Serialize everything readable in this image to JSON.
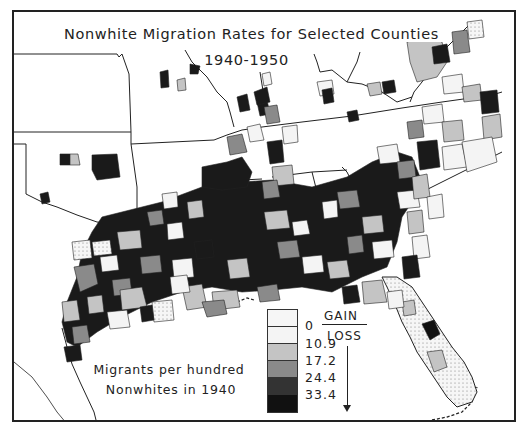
{
  "title": {
    "line1": "Nonwhite Migration Rates for Selected Counties",
    "line2": "1940-1950"
  },
  "legend": {
    "direction_top": "GAIN",
    "direction_bottom": "LOSS",
    "breaks": [
      "0",
      "10.9",
      "17.2",
      "24.4",
      "33.4"
    ],
    "classes": [
      {
        "range": "gain (>0)",
        "fill": "#f2f2f2",
        "pattern": "dotted"
      },
      {
        "range": "0 to 10.9",
        "fill": "#f4f4f4",
        "pattern": "solid"
      },
      {
        "range": "10.9 to 17.2",
        "fill": "#c4c4c4",
        "pattern": "solid"
      },
      {
        "range": "17.2 to 24.4",
        "fill": "#8a8a8a",
        "pattern": "solid"
      },
      {
        "range": "24.4 to 33.4",
        "fill": "#333333",
        "pattern": "solid"
      },
      {
        "range": ">33.4",
        "fill": "#111111",
        "pattern": "solid"
      }
    ]
  },
  "note": {
    "line1": "Migrants per hundred",
    "line2": "Nonwhites in 1940"
  },
  "map": {
    "region": "Southern United States",
    "states_shown": [
      "Texas",
      "Oklahoma",
      "Kansas",
      "Missouri",
      "Arkansas",
      "Louisiana",
      "Mississippi",
      "Alabama",
      "Georgia",
      "Florida",
      "Tennessee",
      "Kentucky",
      "South Carolina",
      "North Carolina",
      "Virginia",
      "West Virginia",
      "Maryland",
      "Delaware"
    ],
    "colors": {
      "outline": "#222222",
      "background": "#ffffff"
    }
  }
}
